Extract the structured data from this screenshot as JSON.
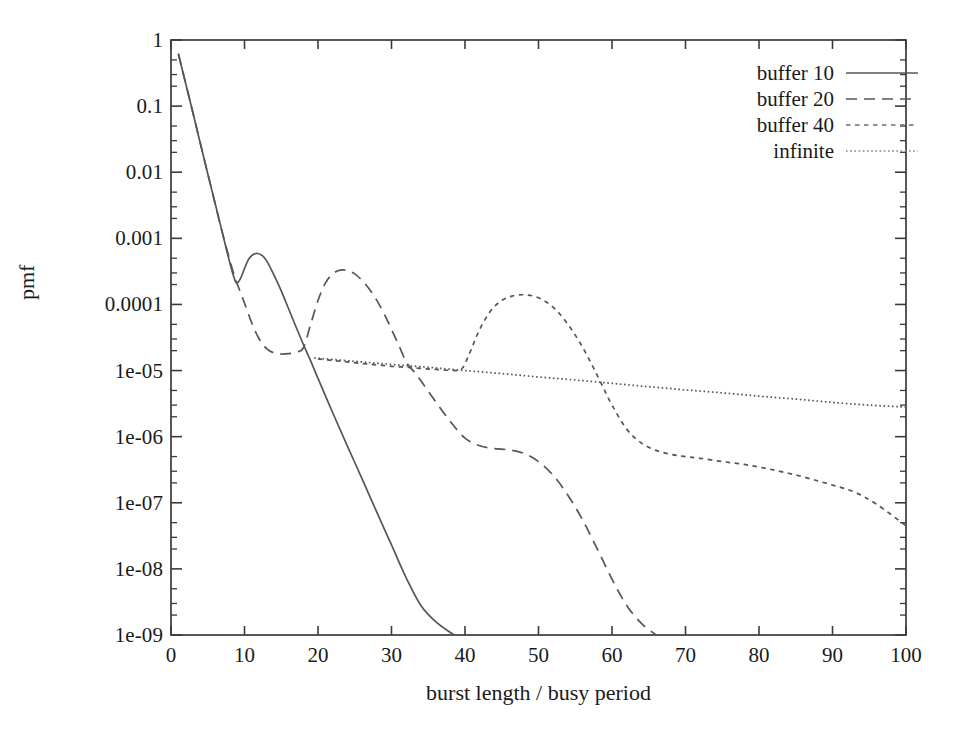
{
  "chart_data": {
    "type": "line",
    "title": "",
    "xlabel": "burst length / busy period",
    "ylabel": "pmf",
    "xlim": [
      0,
      100
    ],
    "ylim": [
      1e-09,
      1
    ],
    "yscale": "log",
    "xscale": "linear",
    "grid": false,
    "legend_position": "top-right",
    "xticks": [
      0,
      10,
      20,
      30,
      40,
      50,
      60,
      70,
      80,
      90,
      100
    ],
    "xtick_labels": [
      "0",
      "10",
      "20",
      "30",
      "40",
      "50",
      "60",
      "70",
      "80",
      "90",
      "100"
    ],
    "yticks": [
      1,
      0.1,
      0.01,
      0.001,
      0.0001,
      1e-05,
      1e-06,
      1e-07,
      1e-08,
      1e-09
    ],
    "ytick_labels": [
      "1",
      "0.1",
      "0.01",
      "0.001",
      "0.0001",
      "1e-05",
      "1e-06",
      "1e-07",
      "1e-08",
      "1e-09"
    ],
    "series": [
      {
        "name": "buffer 10",
        "style": "solid",
        "color": "#55555c",
        "x": [
          1.0,
          2.0,
          3.0,
          4.0,
          5.0,
          6.0,
          7.0,
          8.0,
          8.8,
          9.4,
          10.0,
          10.6,
          11.2,
          11.8,
          12.4,
          13.0,
          14.0,
          15.0,
          16.0,
          17.0,
          18.0,
          19.0,
          20.0,
          22.0,
          24.0,
          26.0,
          28.0,
          30.0,
          32.0,
          34.0,
          36.0,
          38.5
        ],
        "y": [
          0.62,
          0.22,
          0.078,
          0.027,
          0.0095,
          0.0034,
          0.0012,
          0.00043,
          0.00022,
          0.00024,
          0.00035,
          0.00049,
          0.00057,
          0.00059,
          0.00055,
          0.00046,
          0.00028,
          0.00016,
          8.6e-05,
          4.6e-05,
          2.5e-05,
          1.4e-05,
          7.6e-06,
          2.3e-06,
          7.2e-07,
          2.3e-07,
          7.2e-08,
          2.3e-08,
          7.3e-09,
          2.8e-09,
          1.6e-09,
          1e-09
        ]
      },
      {
        "name": "buffer 20",
        "style": "dashed",
        "color": "#55555c",
        "x": [
          1.0,
          3.0,
          5.0,
          7.0,
          8.5,
          9.2,
          10.0,
          11.0,
          12.0,
          13.0,
          14.0,
          15.0,
          16.0,
          17.0,
          18.0,
          19.0,
          20.0,
          21.0,
          22.0,
          23.0,
          24.0,
          25.0,
          26.0,
          27.0,
          28.0,
          29.0,
          30.0,
          31.0,
          32.0,
          33.0,
          34.0,
          36.0,
          38.0,
          40.0,
          42.0,
          44.0,
          46.0,
          48.0,
          50.0,
          52.0,
          54.0,
          56.0,
          58.0,
          60.0,
          62.0,
          64.0,
          66.0
        ],
        "y": [
          0.62,
          0.078,
          0.0095,
          0.0012,
          0.0003,
          0.00018,
          0.000105,
          5.2e-05,
          3e-05,
          2.15e-05,
          1.85e-05,
          1.78e-05,
          1.8e-05,
          1.9e-05,
          2.2e-05,
          5e-05,
          0.000115,
          0.00021,
          0.00029,
          0.00033,
          0.000325,
          0.00029,
          0.00023,
          0.00017,
          0.000115,
          7.2e-05,
          4.2e-05,
          2.4e-05,
          1.35e-05,
          9.8e-06,
          7e-06,
          3.4e-06,
          1.7e-06,
          9.5e-07,
          7.3e-07,
          6.6e-07,
          6.3e-07,
          5.6e-07,
          4.2e-07,
          2.6e-07,
          1.3e-07,
          5.5e-08,
          2e-08,
          7e-09,
          2.8e-09,
          1.5e-09,
          1e-09
        ]
      },
      {
        "name": "buffer 40",
        "style": "dotted-coarse",
        "color": "#6a6a72",
        "x": [
          20.0,
          22.0,
          24.0,
          26.0,
          28.0,
          30.0,
          32.0,
          34.0,
          36.0,
          38.0,
          39.5,
          40.5,
          42.0,
          43.5,
          45.0,
          46.5,
          48.0,
          49.5,
          51.0,
          52.5,
          54.0,
          55.5,
          57.0,
          58.5,
          60.0,
          62.0,
          64.0,
          66.0,
          68.0,
          70.0,
          72.0,
          75.0,
          78.0,
          81.0,
          84.0,
          87.0,
          90.0,
          93.0,
          96.0,
          100.0
        ],
        "y": [
          1.5e-05,
          1.42e-05,
          1.35e-05,
          1.28e-05,
          1.22e-05,
          1.16e-05,
          1.12e-05,
          1.08e-05,
          1.04e-05,
          1.01e-05,
          1.05e-05,
          1.7e-05,
          4.2e-05,
          8e-05,
          0.000115,
          0.000135,
          0.00014,
          0.000132,
          0.00011,
          8e-05,
          5e-05,
          2.8e-05,
          1.4e-05,
          6.5e-06,
          3e-06,
          1.3e-06,
          8e-07,
          6.2e-07,
          5.4e-07,
          5e-07,
          4.7e-07,
          4.2e-07,
          3.8e-07,
          3.3e-07,
          2.8e-07,
          2.3e-07,
          1.85e-07,
          1.45e-07,
          9.5e-08,
          4.5e-08
        ]
      },
      {
        "name": "infinite",
        "style": "dotted-fine",
        "color": "#83838c",
        "x": [
          19.5,
          25.0,
          30.0,
          35.0,
          40.0,
          45.0,
          50.0,
          55.0,
          60.0,
          65.0,
          70.0,
          75.0,
          80.0,
          85.0,
          90.0,
          95.0,
          100.0
        ],
        "y": [
          1.55e-05,
          1.38e-05,
          1.24e-05,
          1.12e-05,
          1e-05,
          9e-06,
          8e-06,
          7.2e-06,
          6.4e-06,
          5.7e-06,
          5.1e-06,
          4.6e-06,
          4.1e-06,
          3.7e-06,
          3.3e-06,
          3e-06,
          2.8e-06
        ]
      }
    ]
  },
  "axis": {
    "x_title": "burst length / busy period",
    "y_title": "pmf"
  },
  "legend": {
    "entries": [
      {
        "label": "buffer 10",
        "style": "solid"
      },
      {
        "label": "buffer 20",
        "style": "dashed"
      },
      {
        "label": "buffer 40",
        "style": "dotted-coarse"
      },
      {
        "label": "infinite",
        "style": "dotted-fine"
      }
    ]
  },
  "colors": {
    "axis": "#3a3a3a",
    "curve": "#55555c",
    "background": "#ffffff"
  }
}
